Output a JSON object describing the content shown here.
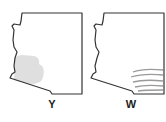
{
  "figure": {
    "panels": [
      {
        "label": "Y",
        "shape": "state-outline",
        "shading": "stippled-region-southwest",
        "shading_color": "#d9d9d9"
      },
      {
        "label": "W",
        "shape": "state-outline",
        "shading": "curved-lines-southeast",
        "shading_color": "#9a9a9a"
      }
    ],
    "outline_color": "#333333"
  }
}
